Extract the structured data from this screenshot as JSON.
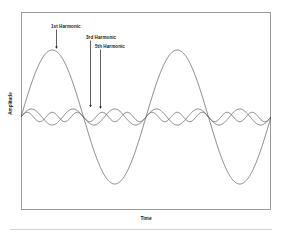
{
  "chart_data": {
    "type": "line",
    "title": "",
    "xlabel": "Time",
    "ylabel": "Amplitude",
    "grid": false,
    "legend_position": "none",
    "x": [
      0,
      0.05,
      0.1,
      0.15,
      0.2,
      0.25,
      0.3,
      0.35,
      0.4,
      0.45,
      0.5,
      0.55,
      0.6,
      0.65,
      0.7,
      0.75,
      0.8,
      0.85,
      0.9,
      0.95,
      1.0,
      1.05,
      1.1,
      1.15,
      1.2,
      1.25,
      1.3,
      1.35,
      1.4,
      1.45,
      1.5,
      1.55,
      1.6,
      1.65,
      1.7,
      1.75,
      1.8,
      1.85,
      1.9,
      1.95,
      2.0
    ],
    "xlim": [
      0,
      2
    ],
    "ylim": [
      -1.15,
      1.15
    ],
    "series": [
      {
        "name": "1st Harmonic",
        "harmonic_number": 1,
        "amplitude": 1.0,
        "cycles_shown": 2,
        "color": "#555555"
      },
      {
        "name": "3rd Harmonic",
        "harmonic_number": 3,
        "amplitude": 0.12,
        "cycles_shown": 6,
        "color": "#555555"
      },
      {
        "name": "5th Harmonic",
        "harmonic_number": 5,
        "amplitude": 0.07,
        "cycles_shown": 10,
        "color": "#555555"
      }
    ],
    "annotations": [
      {
        "label": "1st Harmonic",
        "points_to": "1st Harmonic crest"
      },
      {
        "label": "3rd Harmonic",
        "points_to": "3rd Harmonic crest"
      },
      {
        "label": "5th Harmonic",
        "points_to": "5th Harmonic crest"
      }
    ]
  },
  "figure": {
    "ylabel": "Amplitude",
    "xlabel": "Time",
    "annotation_labels": {
      "first": "1st Harmonic",
      "third": "3rd Harmonic",
      "fifth": "5th Harmonic"
    }
  },
  "colors": {
    "frame": "#9a9a9a",
    "wave": "#555555",
    "annotation": "#1a1a1a",
    "background": "#ffffff",
    "footer_rule": "#d2d2d2"
  }
}
